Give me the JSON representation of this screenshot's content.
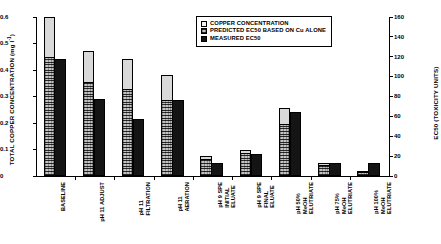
{
  "chart_data": {
    "type": "bar",
    "title": "",
    "xlabel": "",
    "ylabel": "TOTAL COPPER CONCENTRATION (mg l-1)",
    "ylabel_right": "EC50 (TOXICITY UNITS)",
    "ylim": [
      0,
      0.6
    ],
    "ylim_right": [
      0,
      160
    ],
    "grid": false,
    "legend_position": "top-center",
    "categories": [
      "BASELINE",
      "pH 11 ADJUST",
      "pH 11 FILTRATION",
      "pH 11 AERATION",
      "pH 9 SPE INITIAL ELUATE",
      "pH 9 SPE FINAL ELUATE",
      "pH 50% MeOH ELUTRIATE",
      "pH 75% MeOH ELUTRIATE",
      "pH 100% MeOH ELUTRIATE"
    ],
    "category_lines": [
      [
        "BASELINE"
      ],
      [
        "pH 11 ADJUST"
      ],
      [
        "pH 11",
        "FILTRATION"
      ],
      [
        "pH 11",
        "AERATION"
      ],
      [
        "pH 9 SPE",
        "INITIAL",
        "ELUATE"
      ],
      [
        "pH 9 SPE",
        "FINAL",
        "ELUATE"
      ],
      [
        "pH 50%",
        "MeOH",
        "ELUTRIATE"
      ],
      [
        "pH 75%",
        "MeOH",
        "ELUTRIATE"
      ],
      [
        "pH 100%",
        "MeOH",
        "ELUTRIATE"
      ]
    ],
    "series": [
      {
        "name": "COPPER CONCENTRATION",
        "axis": "left",
        "units": "mg l-1",
        "values": [
          0.6,
          0.47,
          0.44,
          0.38,
          0.075,
          0.098,
          0.255,
          0.048,
          0.02
        ]
      },
      {
        "name": "PREDICTED EC50 BASED ON Cu ALONE",
        "axis": "left",
        "units": "mg l-1",
        "values": [
          0.45,
          0.355,
          0.33,
          0.285,
          0.063,
          0.085,
          0.195,
          0.042,
          0.017
        ]
      },
      {
        "name": "MEASURED EC50",
        "axis": "left",
        "units": "mg l-1",
        "values": [
          0.443,
          0.29,
          0.215,
          0.285,
          0.048,
          0.082,
          0.24,
          0.048,
          0.048
        ]
      }
    ],
    "yticks_left": [
      "0",
      "0.1",
      "0.2",
      "0.3",
      "0.4",
      "0.5",
      "0.6"
    ],
    "ytick_values_left": [
      0,
      0.1,
      0.2,
      0.3,
      0.4,
      0.5,
      0.6
    ],
    "yticks_right": [
      "0",
      "20",
      "40",
      "60",
      "80",
      "100",
      "120",
      "140",
      "160"
    ],
    "ytick_values_right": [
      0,
      20,
      40,
      60,
      80,
      100,
      120,
      140,
      160
    ]
  },
  "legend": {
    "items": [
      {
        "label": "COPPER CONCENTRATION",
        "swatch": "copper"
      },
      {
        "label": "PREDICTED EC50 BASED ON Cu ALONE",
        "swatch": "predicted"
      },
      {
        "label": "MEASURED EC50",
        "swatch": "measured"
      }
    ]
  },
  "colors": {
    "copper": "#d9d9d9",
    "predicted": "#8a8a8a",
    "measured": "#141414",
    "axis": "#000000",
    "background": "#ffffff"
  }
}
